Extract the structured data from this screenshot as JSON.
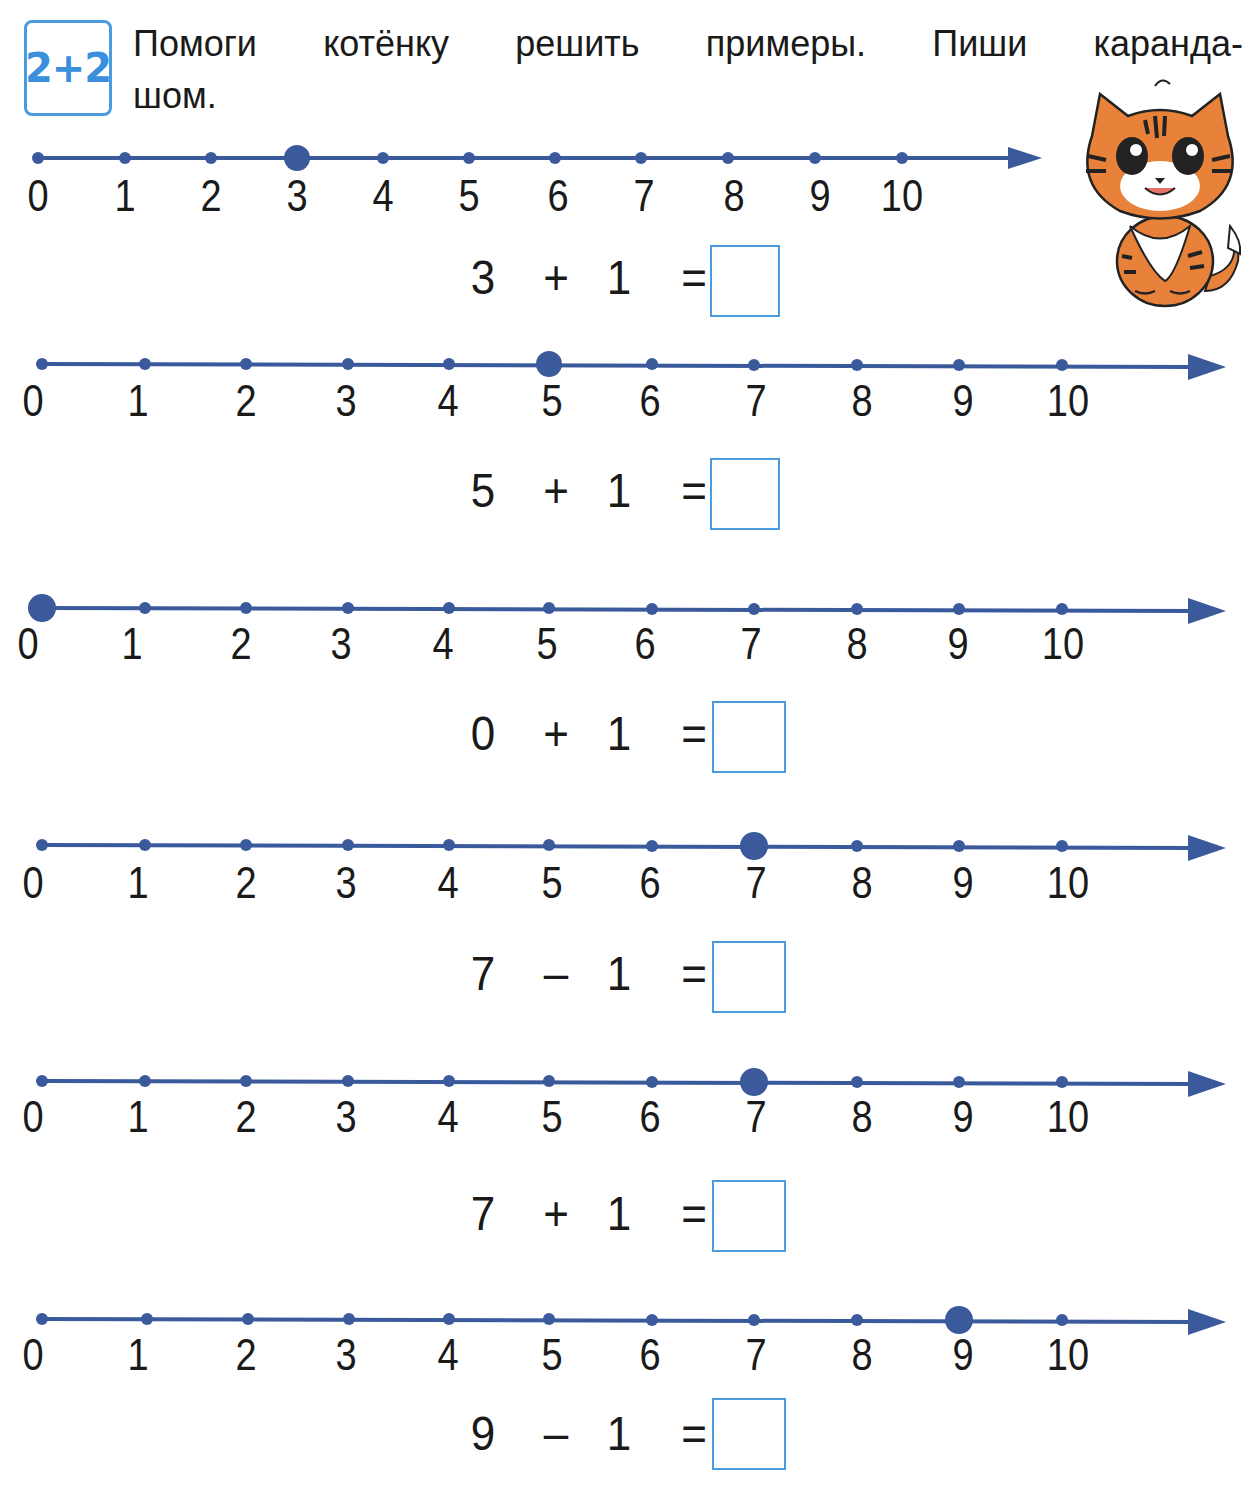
{
  "header": {
    "badge_label": "2+2",
    "instruction_line1": "Помоги котёнку решить примеры. Пиши каранда-",
    "instruction_line2": "шом.",
    "mascot": "kitten-illustration"
  },
  "colors": {
    "line": "#3a5a9c",
    "badge": "#3a8fdc",
    "box_border": "#4a9be0",
    "text": "#1a1a1a"
  },
  "exercises": [
    {
      "marked": 3,
      "a": "3",
      "op": "+",
      "b": "1",
      "eq": "=",
      "answer": ""
    },
    {
      "marked": 5,
      "a": "5",
      "op": "+",
      "b": "1",
      "eq": "=",
      "answer": ""
    },
    {
      "marked": 0,
      "a": "0",
      "op": "+",
      "b": "1",
      "eq": "=",
      "answer": ""
    },
    {
      "marked": 7,
      "a": "7",
      "op": "–",
      "b": "1",
      "eq": "=",
      "answer": ""
    },
    {
      "marked": 7,
      "a": "7",
      "op": "+",
      "b": "1",
      "eq": "=",
      "answer": ""
    },
    {
      "marked": 9,
      "a": "9",
      "op": "–",
      "b": "1",
      "eq": "=",
      "answer": ""
    }
  ],
  "tick_labels": [
    "0",
    "1",
    "2",
    "3",
    "4",
    "5",
    "6",
    "7",
    "8",
    "9",
    "10"
  ]
}
